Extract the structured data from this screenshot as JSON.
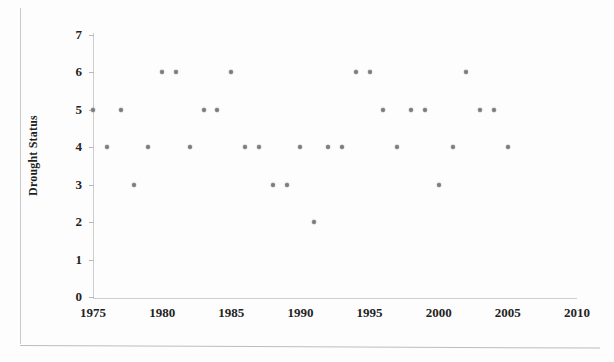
{
  "figure": {
    "background_color": "#fdfdfd",
    "marker_color": "#7b7b82",
    "axis_color": "#cdcdcd"
  },
  "axes": {
    "y_title": "Drought Status",
    "y_ticks": [
      0,
      1,
      2,
      3,
      4,
      5,
      6,
      7
    ],
    "x_ticks": [
      1975,
      1980,
      1985,
      1990,
      1995,
      2000,
      2005,
      2010
    ]
  },
  "chart_data": {
    "type": "scatter",
    "title": "",
    "xlabel": "",
    "ylabel": "Drought Status",
    "xlim": [
      1975,
      2010
    ],
    "ylim": [
      0,
      7
    ],
    "grid": false,
    "legend": null,
    "series": [
      {
        "name": "Drought Status",
        "x": [
          1975,
          1976,
          1977,
          1978,
          1979,
          1980,
          1981,
          1982,
          1983,
          1984,
          1985,
          1986,
          1987,
          1988,
          1989,
          1990,
          1991,
          1992,
          1993,
          1994,
          1995,
          1996,
          1997,
          1998,
          1999,
          2000,
          2001,
          2002,
          2003,
          2004,
          2005
        ],
        "y": [
          5,
          4,
          5,
          3,
          4,
          6,
          6,
          4,
          5,
          5,
          6,
          4,
          4,
          3,
          3,
          4,
          2,
          4,
          4,
          6,
          6,
          5,
          4,
          5,
          5,
          3,
          4,
          6,
          5,
          5,
          4
        ]
      }
    ]
  }
}
